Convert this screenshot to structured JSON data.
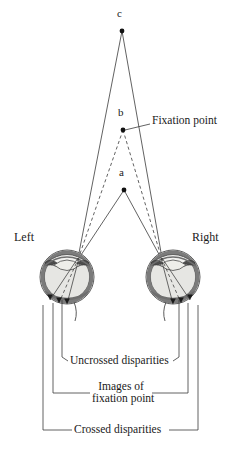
{
  "figure": {
    "colors": {
      "ink": "#1a1a1a",
      "line": "#3a3a3a",
      "sclera_outer": "#f4f4f2",
      "sclera_band": "#6e6e6e",
      "choroid": "#8a8a8a",
      "vitreous": "#e2e2df",
      "lens": "#efefec",
      "iris": "#555555",
      "background": "#ffffff"
    },
    "points": [
      {
        "id": "c",
        "label": "c",
        "x": 122,
        "y": 31,
        "label_x": 118,
        "label_y": 12,
        "description": "far point beyond fixation"
      },
      {
        "id": "b",
        "label": "b",
        "x": 123,
        "y": 130,
        "label_x": 119,
        "label_y": 111,
        "description": "fixation point"
      },
      {
        "id": "a",
        "label": "a",
        "x": 124,
        "y": 190,
        "label_x": 120,
        "label_y": 171,
        "description": "near point in front of fixation"
      }
    ],
    "callouts": [
      {
        "id": "fixation-point",
        "text": "Fixation point",
        "x": 152,
        "y": 121
      }
    ],
    "eye_labels": [
      {
        "id": "left",
        "text": "Left",
        "x": 14,
        "y": 232
      },
      {
        "id": "right",
        "text": "Right",
        "x": 193,
        "y": 232
      }
    ],
    "bracket_labels": [
      {
        "id": "uncrossed-disparities",
        "text": "Uncrossed disparities",
        "x": 120,
        "y": 361
      },
      {
        "id": "images-of-fixation-point",
        "line1": "Images of",
        "line2": "fixation point",
        "x": 120,
        "y": 388
      },
      {
        "id": "crossed-disparities",
        "text": "Crossed disparities",
        "x": 120,
        "y": 430
      }
    ],
    "eyes": [
      {
        "id": "left-eye",
        "cx": 67,
        "cy": 277,
        "r": 27,
        "nodal_x": 78,
        "nodal_y": 258
      },
      {
        "id": "right-eye",
        "cx": 173,
        "cy": 277,
        "r": 27,
        "nodal_x": 162,
        "nodal_y": 258
      }
    ],
    "retinal_images": {
      "left": [
        {
          "id": "left-image-c",
          "x": 50,
          "y": 300,
          "source": "c"
        },
        {
          "id": "left-image-b",
          "x": 59,
          "y": 303,
          "source": "b"
        },
        {
          "id": "left-image-a",
          "x": 67,
          "y": 304,
          "source": "a"
        }
      ],
      "right": [
        {
          "id": "right-image-a",
          "x": 173,
          "y": 304,
          "source": "a"
        },
        {
          "id": "right-image-b",
          "x": 181,
          "y": 303,
          "source": "b"
        },
        {
          "id": "right-image-c",
          "x": 190,
          "y": 300,
          "source": "c"
        }
      ]
    },
    "ray_styles": {
      "solid": "rays from c and a drawn solid",
      "dashed": "rays from b (fixation point) drawn dashed"
    }
  }
}
